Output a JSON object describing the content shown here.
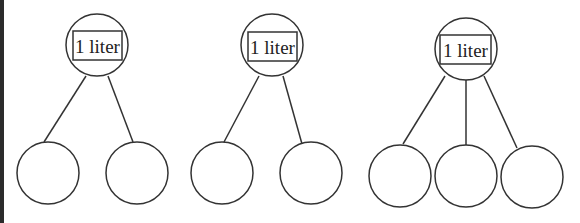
{
  "diagram": {
    "stroke_color": "#333333",
    "trees": [
      {
        "root_label": "1 liter",
        "root": {
          "cx": 97,
          "cy": 45,
          "r": 31
        },
        "box": {
          "x": 73,
          "y": 31,
          "w": 49,
          "h": 29
        },
        "children": [
          {
            "cx": 48,
            "cy": 173,
            "r": 31,
            "line": [
              86,
              76,
              44,
              142
            ]
          },
          {
            "cx": 137,
            "cy": 173,
            "r": 31,
            "line": [
              108,
              76,
              133,
              142
            ]
          }
        ]
      },
      {
        "root_label": "1 liter",
        "root": {
          "cx": 272,
          "cy": 45,
          "r": 31
        },
        "box": {
          "x": 248,
          "y": 32,
          "w": 49,
          "h": 29
        },
        "children": [
          {
            "cx": 222,
            "cy": 173,
            "r": 31,
            "line": [
              259,
              76,
              224,
              142
            ]
          },
          {
            "cx": 311,
            "cy": 173,
            "r": 31,
            "line": [
              283,
              76,
              302,
              144
            ]
          }
        ]
      },
      {
        "root_label": "1 liter",
        "root": {
          "cx": 466,
          "cy": 49,
          "r": 31
        },
        "box": {
          "x": 440,
          "y": 35,
          "w": 51,
          "h": 29
        },
        "children": [
          {
            "cx": 400,
            "cy": 176,
            "r": 31,
            "line": [
              445,
              76,
              403,
              144
            ]
          },
          {
            "cx": 466,
            "cy": 176,
            "r": 31,
            "line": [
              466,
              80,
              466,
              145
            ]
          },
          {
            "cx": 532,
            "cy": 177,
            "r": 31,
            "line": [
              484,
              76,
              517,
              148
            ]
          }
        ]
      }
    ]
  }
}
